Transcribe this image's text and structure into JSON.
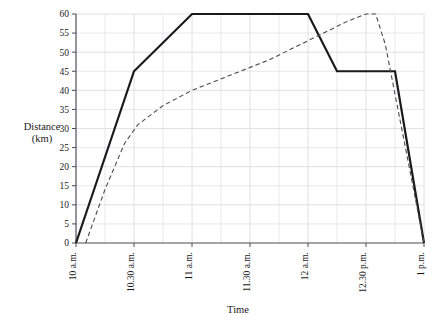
{
  "chart_data": {
    "type": "line",
    "title": "",
    "xlabel": "Time",
    "ylabel": "Distance (km)",
    "ylabel_line1": "Distance",
    "ylabel_line2": "(km)",
    "ylim": [
      0,
      60
    ],
    "ytick_step": 5,
    "yticks": [
      0,
      5,
      10,
      15,
      20,
      25,
      30,
      35,
      40,
      45,
      50,
      55,
      60
    ],
    "ytick_labels": [
      "0",
      "5",
      "10",
      "15",
      "20",
      "25",
      "30",
      "35",
      "40",
      "45",
      "50",
      "55",
      "60"
    ],
    "categories": [
      "10 a.m.",
      "10.30 a.m.",
      "11 a.m.",
      "11.30 a.m.",
      "12 a.m.",
      "12.30 p.m.",
      "1 p.m."
    ],
    "xtick_values": [
      0,
      30,
      60,
      90,
      120,
      150,
      180
    ],
    "xlim_minutes": [
      0,
      180
    ],
    "grid": true,
    "grid_color": "#d8d8e0",
    "minor_grid_per_major": 2,
    "legend": "none",
    "series": [
      {
        "name": "solid-journey",
        "style": "solid",
        "color": "#1a1a1a",
        "width": 2.2,
        "points": [
          {
            "t": 0,
            "time": "10 a.m.",
            "km": 0
          },
          {
            "t": 30,
            "time": "10.30 a.m.",
            "km": 45
          },
          {
            "t": 60,
            "time": "11 a.m.",
            "km": 60
          },
          {
            "t": 120,
            "time": "12 a.m.",
            "km": 60
          },
          {
            "t": 135,
            "time": "12.15 p.m.",
            "km": 45
          },
          {
            "t": 165,
            "time": "12.45 p.m.",
            "km": 45
          },
          {
            "t": 180,
            "time": "1 p.m.",
            "km": 0
          }
        ]
      },
      {
        "name": "dashed-journey",
        "style": "dashed",
        "color": "#4a4a4a",
        "width": 1.1,
        "points": [
          {
            "t": 5,
            "time": "10.05 a.m.",
            "km": 0
          },
          {
            "t": 15,
            "time": "10.15 a.m.",
            "km": 14
          },
          {
            "t": 25,
            "time": "10.25 a.m.",
            "km": 26
          },
          {
            "t": 32,
            "time": "10.32 a.m.",
            "km": 31
          },
          {
            "t": 45,
            "time": "10.45 a.m.",
            "km": 36
          },
          {
            "t": 60,
            "time": "11 a.m.",
            "km": 40
          },
          {
            "t": 80,
            "time": "11.20 a.m.",
            "km": 44
          },
          {
            "t": 100,
            "time": "11.40 a.m.",
            "km": 48
          },
          {
            "t": 120,
            "time": "12 a.m.",
            "km": 53
          },
          {
            "t": 140,
            "time": "12.20 p.m.",
            "km": 58
          },
          {
            "t": 150,
            "time": "12.30 p.m.",
            "km": 60
          },
          {
            "t": 155,
            "time": "12.35 p.m.",
            "km": 60
          },
          {
            "t": 160,
            "time": "12.40 p.m.",
            "km": 52
          },
          {
            "t": 180,
            "time": "1 p.m.",
            "km": 0
          }
        ]
      }
    ]
  },
  "plot_geometry": {
    "left": 76,
    "right": 424,
    "top": 14,
    "bottom": 243
  }
}
